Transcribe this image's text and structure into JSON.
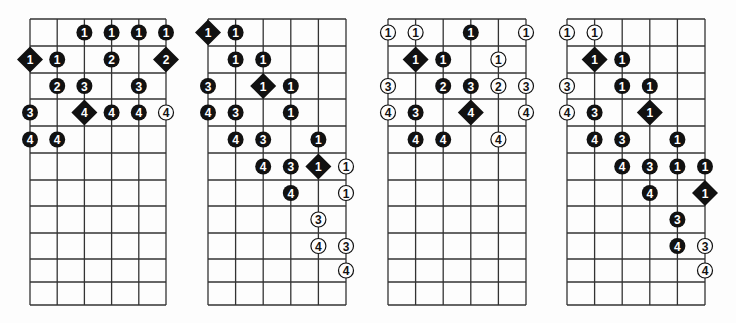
{
  "colors": {
    "ink": "#111111",
    "paper": "#fdfdfd",
    "grid": "#333333"
  },
  "legend": {
    "filled_circle": "fretted note",
    "diamond": "root note",
    "open_circle": "optional / extended note"
  },
  "diagrams": [
    {
      "id": "diagram-1",
      "strings": 6,
      "frets": 11,
      "notes": [
        {
          "s": 2,
          "r": 0,
          "f": "1",
          "t": "dot"
        },
        {
          "s": 3,
          "r": 0,
          "f": "1",
          "t": "dot"
        },
        {
          "s": 4,
          "r": 0,
          "f": "1",
          "t": "dot"
        },
        {
          "s": 5,
          "r": 0,
          "f": "1",
          "t": "dot"
        },
        {
          "s": 0,
          "r": 1,
          "f": "1",
          "t": "root"
        },
        {
          "s": 1,
          "r": 1,
          "f": "1",
          "t": "dot"
        },
        {
          "s": 3,
          "r": 1,
          "f": "2",
          "t": "dot"
        },
        {
          "s": 5,
          "r": 1,
          "f": "2",
          "t": "root"
        },
        {
          "s": 1,
          "r": 2,
          "f": "2",
          "t": "dot"
        },
        {
          "s": 2,
          "r": 2,
          "f": "3",
          "t": "dot"
        },
        {
          "s": 4,
          "r": 2,
          "f": "3",
          "t": "dot"
        },
        {
          "s": 0,
          "r": 3,
          "f": "3",
          "t": "dot"
        },
        {
          "s": 2,
          "r": 3,
          "f": "4",
          "t": "root"
        },
        {
          "s": 3,
          "r": 3,
          "f": "4",
          "t": "dot"
        },
        {
          "s": 4,
          "r": 3,
          "f": "4",
          "t": "dot"
        },
        {
          "s": 5,
          "r": 3,
          "f": "4",
          "t": "open"
        },
        {
          "s": 0,
          "r": 4,
          "f": "4",
          "t": "dot"
        },
        {
          "s": 1,
          "r": 4,
          "f": "4",
          "t": "dot"
        }
      ]
    },
    {
      "id": "diagram-2",
      "strings": 6,
      "frets": 11,
      "notes": [
        {
          "s": 0,
          "r": 0,
          "f": "1",
          "t": "root"
        },
        {
          "s": 1,
          "r": 0,
          "f": "1",
          "t": "dot"
        },
        {
          "s": 1,
          "r": 1,
          "f": "1",
          "t": "dot"
        },
        {
          "s": 2,
          "r": 1,
          "f": "1",
          "t": "dot"
        },
        {
          "s": 0,
          "r": 2,
          "f": "3",
          "t": "dot"
        },
        {
          "s": 2,
          "r": 2,
          "f": "1",
          "t": "root"
        },
        {
          "s": 3,
          "r": 2,
          "f": "1",
          "t": "dot"
        },
        {
          "s": 0,
          "r": 3,
          "f": "4",
          "t": "dot"
        },
        {
          "s": 1,
          "r": 3,
          "f": "3",
          "t": "dot"
        },
        {
          "s": 3,
          "r": 3,
          "f": "1",
          "t": "dot"
        },
        {
          "s": 1,
          "r": 4,
          "f": "4",
          "t": "dot"
        },
        {
          "s": 2,
          "r": 4,
          "f": "3",
          "t": "dot"
        },
        {
          "s": 4,
          "r": 4,
          "f": "1",
          "t": "dot"
        },
        {
          "s": 2,
          "r": 5,
          "f": "4",
          "t": "dot"
        },
        {
          "s": 3,
          "r": 5,
          "f": "3",
          "t": "dot"
        },
        {
          "s": 4,
          "r": 5,
          "f": "1",
          "t": "root"
        },
        {
          "s": 5,
          "r": 5,
          "f": "1",
          "t": "open"
        },
        {
          "s": 3,
          "r": 6,
          "f": "4",
          "t": "dot"
        },
        {
          "s": 5,
          "r": 6,
          "f": "1",
          "t": "open"
        },
        {
          "s": 4,
          "r": 7,
          "f": "3",
          "t": "open"
        },
        {
          "s": 4,
          "r": 8,
          "f": "4",
          "t": "open"
        },
        {
          "s": 5,
          "r": 8,
          "f": "3",
          "t": "open"
        },
        {
          "s": 5,
          "r": 9,
          "f": "4",
          "t": "open"
        }
      ]
    },
    {
      "id": "diagram-3",
      "strings": 6,
      "frets": 11,
      "notes": [
        {
          "s": 0,
          "r": 0,
          "f": "1",
          "t": "open"
        },
        {
          "s": 1,
          "r": 0,
          "f": "1",
          "t": "open"
        },
        {
          "s": 3,
          "r": 0,
          "f": "1",
          "t": "dot"
        },
        {
          "s": 5,
          "r": 0,
          "f": "1",
          "t": "open"
        },
        {
          "s": 1,
          "r": 1,
          "f": "1",
          "t": "root"
        },
        {
          "s": 2,
          "r": 1,
          "f": "1",
          "t": "dot"
        },
        {
          "s": 4,
          "r": 1,
          "f": "1",
          "t": "open"
        },
        {
          "s": 0,
          "r": 2,
          "f": "3",
          "t": "open"
        },
        {
          "s": 2,
          "r": 2,
          "f": "2",
          "t": "dot"
        },
        {
          "s": 3,
          "r": 2,
          "f": "3",
          "t": "dot"
        },
        {
          "s": 4,
          "r": 2,
          "f": "2",
          "t": "open"
        },
        {
          "s": 5,
          "r": 2,
          "f": "3",
          "t": "open"
        },
        {
          "s": 0,
          "r": 3,
          "f": "4",
          "t": "open"
        },
        {
          "s": 1,
          "r": 3,
          "f": "3",
          "t": "dot"
        },
        {
          "s": 3,
          "r": 3,
          "f": "4",
          "t": "root"
        },
        {
          "s": 5,
          "r": 3,
          "f": "4",
          "t": "open"
        },
        {
          "s": 1,
          "r": 4,
          "f": "4",
          "t": "dot"
        },
        {
          "s": 2,
          "r": 4,
          "f": "4",
          "t": "dot"
        },
        {
          "s": 4,
          "r": 4,
          "f": "4",
          "t": "open"
        }
      ]
    },
    {
      "id": "diagram-4",
      "strings": 6,
      "frets": 11,
      "notes": [
        {
          "s": 0,
          "r": 0,
          "f": "1",
          "t": "open"
        },
        {
          "s": 1,
          "r": 0,
          "f": "1",
          "t": "open"
        },
        {
          "s": 1,
          "r": 1,
          "f": "1",
          "t": "root"
        },
        {
          "s": 2,
          "r": 1,
          "f": "1",
          "t": "dot"
        },
        {
          "s": 0,
          "r": 2,
          "f": "3",
          "t": "open"
        },
        {
          "s": 2,
          "r": 2,
          "f": "1",
          "t": "dot"
        },
        {
          "s": 3,
          "r": 2,
          "f": "1",
          "t": "dot"
        },
        {
          "s": 0,
          "r": 3,
          "f": "4",
          "t": "open"
        },
        {
          "s": 1,
          "r": 3,
          "f": "3",
          "t": "dot"
        },
        {
          "s": 3,
          "r": 3,
          "f": "1",
          "t": "root"
        },
        {
          "s": 1,
          "r": 4,
          "f": "4",
          "t": "dot"
        },
        {
          "s": 2,
          "r": 4,
          "f": "3",
          "t": "dot"
        },
        {
          "s": 4,
          "r": 4,
          "f": "1",
          "t": "dot"
        },
        {
          "s": 2,
          "r": 5,
          "f": "4",
          "t": "dot"
        },
        {
          "s": 3,
          "r": 5,
          "f": "3",
          "t": "dot"
        },
        {
          "s": 4,
          "r": 5,
          "f": "1",
          "t": "dot"
        },
        {
          "s": 5,
          "r": 5,
          "f": "1",
          "t": "dot"
        },
        {
          "s": 3,
          "r": 6,
          "f": "4",
          "t": "dot"
        },
        {
          "s": 5,
          "r": 6,
          "f": "1",
          "t": "root"
        },
        {
          "s": 4,
          "r": 7,
          "f": "3",
          "t": "dot"
        },
        {
          "s": 4,
          "r": 8,
          "f": "4",
          "t": "dot"
        },
        {
          "s": 5,
          "r": 8,
          "f": "3",
          "t": "open"
        },
        {
          "s": 5,
          "r": 9,
          "f": "4",
          "t": "open"
        }
      ]
    }
  ]
}
